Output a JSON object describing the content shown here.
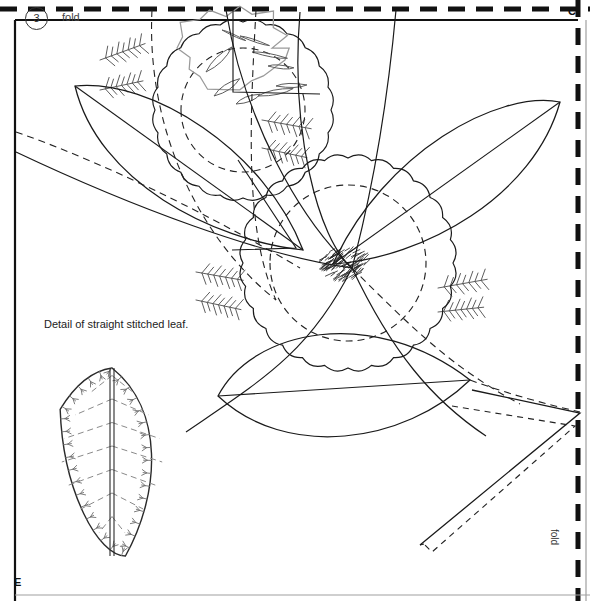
{
  "page": {
    "width": 590,
    "height": 601,
    "background": "#ffffff",
    "ink": "#1a1a1a",
    "light_ink": "#7a7a7a"
  },
  "labels": {
    "step_number": "3",
    "fold_top": "fold",
    "fold_right": "fold",
    "corner_c": "C",
    "corner_e": "E",
    "detail_caption": "Detail of straight stitched leaf."
  },
  "borders": {
    "top_fold_line": {
      "style": "dashed",
      "color": "#111111",
      "width": 4,
      "dash": "16 10",
      "y": 9
    },
    "right_fold_line": {
      "style": "dashed",
      "color": "#111111",
      "width": 4,
      "dash": "16 10",
      "x": 578
    },
    "left_edge": {
      "style": "solid",
      "color": "#111111",
      "width": 2,
      "x": 15
    },
    "inner_top_edge": {
      "style": "solid",
      "color": "#111111",
      "width": 2,
      "y": 20
    },
    "bottom_edge": {
      "style": "solid",
      "color": "#9a9a9a",
      "width": 1,
      "y": 595
    },
    "right_inner_edge": {
      "style": "solid",
      "color": "#9a9a9a",
      "width": 1,
      "x": 585
    }
  },
  "motifs": {
    "flower_top": {
      "name": "scalloped-flower-top",
      "center_x": 243,
      "center_y": 110,
      "radius": 88,
      "scallops": 24,
      "inner_dashed_radius": 62,
      "center_blob": {
        "x": 232,
        "y": 48,
        "rx": 52,
        "ry": 40,
        "stroke": "#9a9a9a"
      },
      "petal_count": 9
    },
    "flower_center": {
      "name": "scalloped-flower-center",
      "center_x": 348,
      "center_y": 263,
      "radius": 105,
      "scallops": 28,
      "inner_dashed_radius": 78,
      "hatch_center": {
        "x": 341,
        "y": 265,
        "rx": 23,
        "ry": 17,
        "strokes": 120
      }
    },
    "leaves_large": [
      {
        "name": "leaf-upper-left",
        "x1": 75,
        "y1": 86,
        "x2": 300,
        "y2": 250
      },
      {
        "name": "leaf-upper-right",
        "x1": 560,
        "y1": 102,
        "x2": 333,
        "y2": 264
      },
      {
        "name": "leaf-lower-left",
        "x1": 218,
        "y1": 396,
        "x2": 470,
        "y2": 380
      }
    ],
    "stitch_sprigs": [
      {
        "name": "sprig-top-left-1",
        "x": 100,
        "y": 60,
        "angle": -20,
        "len": 48
      },
      {
        "name": "sprig-top-left-2",
        "x": 100,
        "y": 90,
        "angle": -12,
        "len": 44
      },
      {
        "name": "sprig-top-right-1",
        "x": 262,
        "y": 120,
        "angle": 10,
        "len": 50
      },
      {
        "name": "sprig-top-right-2",
        "x": 262,
        "y": 148,
        "angle": 12,
        "len": 46
      },
      {
        "name": "sprig-mid-left-1",
        "x": 196,
        "y": 272,
        "angle": 10,
        "len": 48
      },
      {
        "name": "sprig-mid-left-2",
        "x": 196,
        "y": 300,
        "angle": 12,
        "len": 46
      },
      {
        "name": "sprig-mid-right-1",
        "x": 438,
        "y": 288,
        "angle": -10,
        "len": 50
      },
      {
        "name": "sprig-mid-right-2",
        "x": 438,
        "y": 312,
        "angle": -6,
        "len": 46
      }
    ],
    "detail_leaf": {
      "name": "detail-straight-stitched-leaf",
      "center_x": 112,
      "top_y": 368,
      "bottom_y": 556,
      "half_width": 48,
      "vein_rows": 7,
      "edge_stitches": 34,
      "stitch_color": "#6f6f6f",
      "vein_style": "dashed"
    },
    "band_strip": {
      "name": "folded-band-strip",
      "solid_points": "472,390 580,413 420,545",
      "dashed_points": "452,405 575,425 432,552"
    }
  },
  "construction_lines": {
    "dashed_color": "#222222",
    "solid_color": "#1a1a1a",
    "dash_pattern": "7 5"
  }
}
